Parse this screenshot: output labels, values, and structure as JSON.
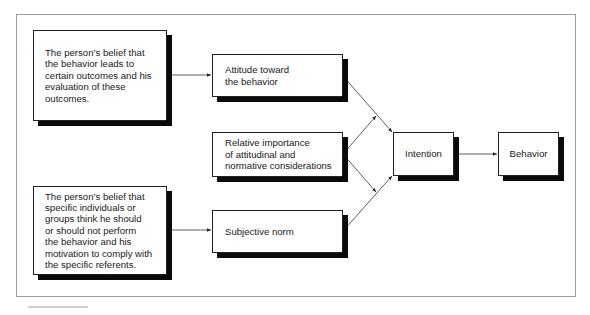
{
  "diagram": {
    "nodes": {
      "belief_outcomes": "The person’s belief that\nthe behavior leads to\ncertain outcomes and his\nevaluation of these\noutcomes.",
      "attitude": "Attitude toward\nthe behavior",
      "relative_importance": "Relative importance\nof attitudinal and\nnormative considerations",
      "belief_referents": "The person’s belief that\nspecific individuals or\ngroups think he should\nor should not perform\nthe behavior and his\nmotivation to comply with\nthe specific referents.",
      "subjective_norm": "Subjective norm",
      "intention": "Intention",
      "behavior": "Behavior"
    },
    "edges": [
      {
        "from": "belief_outcomes",
        "to": "attitude"
      },
      {
        "from": "belief_referents",
        "to": "subjective_norm"
      },
      {
        "from": "attitude",
        "to": "intention"
      },
      {
        "from": "subjective_norm",
        "to": "intention"
      },
      {
        "from": "relative_importance",
        "to": "attitude-intention link"
      },
      {
        "from": "relative_importance",
        "to": "subjective_norm-intention link"
      },
      {
        "from": "intention",
        "to": "behavior"
      }
    ],
    "colors": {
      "border": "#222222",
      "shadow": "#0a0a0a",
      "frame": "#9a9a9a",
      "line": "#333333"
    }
  }
}
